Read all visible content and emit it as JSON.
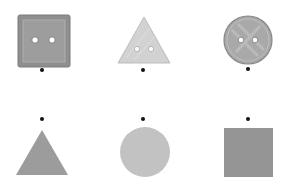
{
  "figure": {
    "rows": [
      {
        "row": "buttons",
        "items": [
          {
            "shape": "square-button",
            "holes": 2
          },
          {
            "shape": "triangle-button",
            "holes": 2
          },
          {
            "shape": "circle-button",
            "holes": 2
          }
        ]
      },
      {
        "row": "plain-shapes",
        "items": [
          {
            "shape": "triangle"
          },
          {
            "shape": "circle"
          },
          {
            "shape": "square"
          }
        ]
      }
    ],
    "colors": {
      "square_button": "#8f8f8f",
      "square_button_inner": "#9a9a9a",
      "triangle_button": "#d0d0d0",
      "circle_button": "#a8a8a8",
      "triangle": "#9c9c9c",
      "circle": "#c2c2c2",
      "square": "#959595",
      "dot": "#111111",
      "hole": "#ffffff"
    }
  }
}
